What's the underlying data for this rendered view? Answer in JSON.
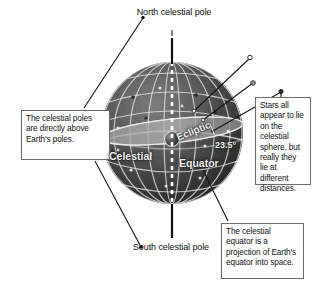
{
  "figure": {
    "title": "The celestial sphere",
    "background_color": "#ffffff"
  },
  "callouts": [
    {
      "id": "poles",
      "text": "The celestial poles are directly above Earth's poles.",
      "border_color": "#6b6b6b"
    },
    {
      "id": "stars",
      "text": "Stars all appear to lie on the celestial sphere, but really they lie at different distances.",
      "border_color": "#6b6b6b"
    },
    {
      "id": "equator",
      "text": "The celestial equator is a projection of Earth's equator into space.",
      "border_color": "#6b6b6b"
    }
  ],
  "pointer_labels": [
    {
      "id": "north-celestial-pole",
      "text": "North celestial pole"
    },
    {
      "id": "south-celestial-pole",
      "text": "South celestial pole"
    }
  ],
  "globe_labels": [
    {
      "id": "celestial",
      "text": "Celestial"
    },
    {
      "id": "equator",
      "text": "Equator"
    },
    {
      "id": "ecliptic",
      "text": "Ecliptic"
    },
    {
      "id": "tilt-angle",
      "text": "23.5°"
    }
  ],
  "colors": {
    "sphere_dark": "#3a3a3a",
    "sphere_mid": "#5a5a5a",
    "sphere_light": "#8f8f8f",
    "grid_line": "#e8e8e8",
    "ecliptic_plane": "#9a9a9a",
    "axis_dashed": "#ffffff",
    "leader_line": "#1a1a1a",
    "earth": "#4a4a4a"
  }
}
